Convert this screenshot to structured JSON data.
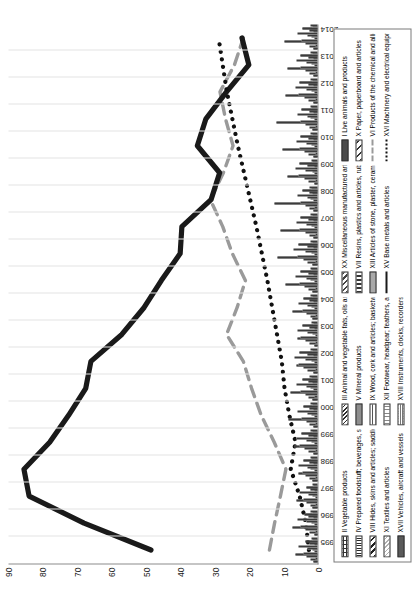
{
  "chart_data": {
    "type": "bar",
    "title": "",
    "subtitle": "",
    "xlabel": "",
    "ylabel": "",
    "ylim": [
      0,
      90
    ],
    "yticks": [
      90,
      80,
      70,
      60,
      50,
      40,
      30,
      20,
      10,
      0
    ],
    "grid": "vertical",
    "orientation": "rotated-90-ccw",
    "legend_position": "bottom",
    "categories": [
      "1995",
      "1996",
      "1997",
      "1998",
      "1999",
      "2000",
      "2001",
      "2002",
      "2003",
      "2004",
      "2005",
      "2006",
      "2007",
      "2008",
      "2009",
      "2010",
      "2011",
      "2012",
      "2013",
      "2014"
    ],
    "series": [
      {
        "name": "I Live animals and products",
        "type": "bar",
        "pattern": "solid-dark",
        "values": [
          1.2,
          1.0,
          1.4,
          1.5,
          1.1,
          1.3,
          1.5,
          1.2,
          1.0,
          1.4,
          1.6,
          1.5,
          1.3,
          1.1,
          1.0,
          1.2,
          1.4,
          1.3,
          1.1,
          1.2
        ]
      },
      {
        "name": "II Vegetable products",
        "type": "bar",
        "pattern": "brick",
        "values": [
          2.1,
          2.4,
          2.0,
          2.3,
          2.6,
          2.2,
          2.5,
          2.8,
          2.3,
          2.1,
          2.6,
          2.9,
          2.4,
          2.2,
          2.7,
          2.5,
          2.3,
          2.6,
          2.4,
          2.2
        ]
      },
      {
        "name": "III Animal and vegetable fats, oils and waxes",
        "type": "bar",
        "pattern": "diag-dense",
        "values": [
          0.5,
          0.6,
          0.4,
          0.7,
          0.5,
          0.6,
          0.8,
          0.5,
          0.4,
          0.6,
          0.7,
          0.5,
          0.6,
          0.8,
          0.5,
          0.7,
          0.6,
          0.5,
          0.7,
          0.6
        ]
      },
      {
        "name": "IV Prepared foodstuff; beverages, spirits, vinegar; tobacco",
        "type": "bar",
        "pattern": "vline",
        "values": [
          3.2,
          3.6,
          3.1,
          3.4,
          3.8,
          3.3,
          3.6,
          4.0,
          3.5,
          3.2,
          3.7,
          4.1,
          3.6,
          3.4,
          3.9,
          3.7,
          3.5,
          3.8,
          3.6,
          3.4
        ]
      },
      {
        "name": "V Mineral products",
        "type": "bar",
        "pattern": "solid-grey",
        "values": [
          6.5,
          7.2,
          6.0,
          5.4,
          6.8,
          8.5,
          7.9,
          6.2,
          5.8,
          7.4,
          9.2,
          11.5,
          10.8,
          12.4,
          8.6,
          10.2,
          11.8,
          9.4,
          8.8,
          9.6
        ]
      },
      {
        "name": "VI Products of the chemical and allied industries",
        "type": "line",
        "style": "dashed",
        "color": "#9a9a9a",
        "values": [
          14.0,
          12.5,
          10.8,
          9.2,
          12.6,
          16.4,
          19.2,
          21.6,
          26.5,
          23.4,
          21.0,
          24.8,
          27.6,
          31.2,
          27.4,
          24.6,
          26.8,
          28.4,
          24.2,
          21.6
        ]
      },
      {
        "name": "VII Resins, plastics and articles, rubber and articles",
        "type": "bar",
        "pattern": "dotted-box",
        "values": [
          4.2,
          4.8,
          4.0,
          4.5,
          5.1,
          4.6,
          5.0,
          5.6,
          4.8,
          4.4,
          5.2,
          5.8,
          5.1,
          4.9,
          5.5,
          5.2,
          4.9,
          5.4,
          5.0,
          4.7
        ]
      },
      {
        "name": "VIII Hides, skins and articles; saddlery and travel goods",
        "type": "bar",
        "pattern": "diag-bold",
        "values": [
          0.8,
          0.9,
          0.7,
          1.0,
          0.8,
          0.9,
          1.1,
          0.8,
          0.7,
          0.9,
          1.0,
          0.8,
          0.9,
          1.1,
          0.8,
          1.0,
          0.9,
          0.8,
          1.0,
          0.9
        ]
      },
      {
        "name": "IX Wood, cork and articles; basketware",
        "type": "bar",
        "pattern": "dash-fill",
        "values": [
          1.6,
          1.8,
          1.5,
          1.9,
          1.7,
          1.8,
          2.0,
          1.7,
          1.5,
          1.8,
          1.9,
          1.7,
          1.8,
          2.0,
          1.6,
          1.8,
          1.9,
          1.7,
          1.8,
          1.7
        ]
      },
      {
        "name": "X Paper, paperboard and articles",
        "type": "bar",
        "pattern": "diag-wide",
        "values": [
          2.8,
          3.1,
          2.6,
          3.0,
          3.3,
          2.9,
          3.2,
          3.5,
          3.0,
          2.8,
          3.3,
          3.6,
          3.1,
          2.9,
          3.4,
          3.2,
          3.0,
          3.3,
          3.1,
          2.9
        ]
      },
      {
        "name": "XI Textiles and articles",
        "type": "bar",
        "pattern": "light-hatch",
        "values": [
          5.4,
          5.9,
          5.1,
          5.6,
          6.2,
          5.7,
          6.1,
          6.7,
          5.9,
          5.4,
          6.3,
          6.9,
          6.1,
          5.8,
          6.5,
          6.2,
          5.9,
          6.4,
          6.0,
          5.7
        ]
      },
      {
        "name": "XII Footwear, headgear; feathers, artif. flowers, fans",
        "type": "bar",
        "pattern": "vline-light",
        "values": [
          1.0,
          1.2,
          0.9,
          1.3,
          1.1,
          1.2,
          1.4,
          1.1,
          0.9,
          1.2,
          1.3,
          1.1,
          1.2,
          1.4,
          1.0,
          1.2,
          1.3,
          1.1,
          1.2,
          1.1
        ]
      },
      {
        "name": "XIII Articles of stone, plaster, ceramic prod.; glass",
        "type": "bar",
        "pattern": "solid-mid",
        "values": [
          2.2,
          2.5,
          2.0,
          2.4,
          2.7,
          2.3,
          2.6,
          2.9,
          2.4,
          2.2,
          2.7,
          3.0,
          2.5,
          2.3,
          2.8,
          2.6,
          2.4,
          2.7,
          2.5,
          2.3
        ]
      },
      {
        "name": "XV Base metals and articles",
        "type": "line",
        "style": "solid",
        "color": "#1a1a1a",
        "values": [
          48.5,
          68.0,
          84.0,
          85.5,
          78.0,
          72.5,
          67.5,
          66.0,
          57.0,
          50.5,
          45.5,
          40.0,
          39.5,
          31.0,
          28.5,
          35.0,
          32.5,
          26.5,
          20.0,
          22.0
        ]
      },
      {
        "name": "XVI Machinery and electrical equipment",
        "type": "line",
        "style": "dotted",
        "color": "#111111",
        "values": [
          2.5,
          3.4,
          5.2,
          7.8,
          6.4,
          8.2,
          9.6,
          10.4,
          11.8,
          13.2,
          14.6,
          16.2,
          17.8,
          19.6,
          21.4,
          23.2,
          24.8,
          26.4,
          27.6,
          28.8
        ]
      },
      {
        "name": "XVII Vehicles, aircraft and vessels",
        "type": "bar",
        "pattern": "solid-dark2",
        "values": [
          3.4,
          3.8,
          3.2,
          4.0,
          4.6,
          4.1,
          4.5,
          5.2,
          4.4,
          4.0,
          4.9,
          5.6,
          4.8,
          4.5,
          5.3,
          5.0,
          4.6,
          5.1,
          4.8,
          4.4
        ]
      },
      {
        "name": "XVIII Instruments, clocks, recorders and reproducers",
        "type": "bar",
        "pattern": "checker",
        "values": [
          1.4,
          1.6,
          1.3,
          1.7,
          1.5,
          1.6,
          1.8,
          1.5,
          1.3,
          1.6,
          1.7,
          1.5,
          1.6,
          1.8,
          1.4,
          1.6,
          1.7,
          1.5,
          1.6,
          1.5
        ]
      },
      {
        "name": "XX Miscellaneous manufactured articles",
        "type": "bar",
        "pattern": "diag-med",
        "values": [
          1.8,
          2.0,
          1.6,
          2.1,
          1.9,
          2.0,
          2.2,
          1.9,
          1.7,
          2.0,
          2.1,
          1.9,
          2.0,
          2.2,
          1.8,
          2.0,
          2.1,
          1.9,
          2.0,
          1.9
        ]
      }
    ]
  },
  "axes": {
    "y": {
      "labels": [
        "90",
        "80",
        "70",
        "60",
        "50",
        "40",
        "30",
        "20",
        "10",
        "0"
      ]
    },
    "x": {
      "labels": [
        "1995",
        "1996",
        "1997",
        "1998",
        "1999",
        "2000",
        "2001",
        "2002",
        "2003",
        "2004",
        "2005",
        "2006",
        "2007",
        "2008",
        "2009",
        "2010",
        "2011",
        "2012",
        "2013",
        "2014"
      ]
    }
  },
  "legend": {
    "items": [
      {
        "label": "II Vegetable products",
        "kind": "swatch",
        "pattern": "brick"
      },
      {
        "label": "IV Prepared foodstuff; beverages, spirits, vinegar; tobacco",
        "kind": "swatch",
        "pattern": "vline"
      },
      {
        "label": "VIII Hides, skins and articles; saddlery and travel goods",
        "kind": "swatch",
        "pattern": "diag-bold"
      },
      {
        "label": "XI Textiles and articles",
        "kind": "swatch",
        "pattern": "light-hatch"
      },
      {
        "label": "XVII Vehicles, aircraft and vessels",
        "kind": "swatch",
        "pattern": "solid-dark2"
      },
      {
        "label": "III Animal and vegetable fats, oils and waxes",
        "kind": "swatch",
        "pattern": "diag-dense"
      },
      {
        "label": "V Mineral products",
        "kind": "swatch",
        "pattern": "solid-grey"
      },
      {
        "label": "IX Wood, cork and articles; basketware",
        "kind": "swatch",
        "pattern": "dash-fill"
      },
      {
        "label": "XII Footwear, headgear; feathers, artif. flowers, fans",
        "kind": "swatch",
        "pattern": "vline-light"
      },
      {
        "label": "XVIII Instruments, clocks, recorders and reproducers",
        "kind": "swatch",
        "pattern": "checker"
      },
      {
        "label": "XX Miscellaneous manufactured articles",
        "kind": "swatch",
        "pattern": "diag-med"
      },
      {
        "label": "VII Resins, plastics and articles, rubber and articles",
        "kind": "swatch",
        "pattern": "dotted-box"
      },
      {
        "label": "XIII Articles of stone, plaster, ceramic prod.; glass",
        "kind": "swatch",
        "pattern": "solid-mid"
      },
      {
        "label": "XV Base metals and articles",
        "kind": "line",
        "pattern": "solid"
      },
      {
        "label": "",
        "kind": "empty",
        "pattern": "none"
      },
      {
        "label": "I Live animals and products",
        "kind": "swatch",
        "pattern": "solid-dark"
      },
      {
        "label": "X Paper, paperboard and articles",
        "kind": "swatch",
        "pattern": "diag-wide"
      },
      {
        "label": "VI Products of the chemical and allied industries",
        "kind": "line",
        "pattern": "dashed"
      },
      {
        "label": "XVI Machinery and electrical equipment",
        "kind": "line",
        "pattern": "dotted"
      },
      {
        "label": "",
        "kind": "empty",
        "pattern": "none"
      }
    ]
  },
  "colors": {
    "axis": "#8c8c8c",
    "grid": "#e3e3e3",
    "base_metals_line": "#1a1a1a",
    "chemical_line": "#9a9a9a",
    "machinery_line": "#111111"
  }
}
